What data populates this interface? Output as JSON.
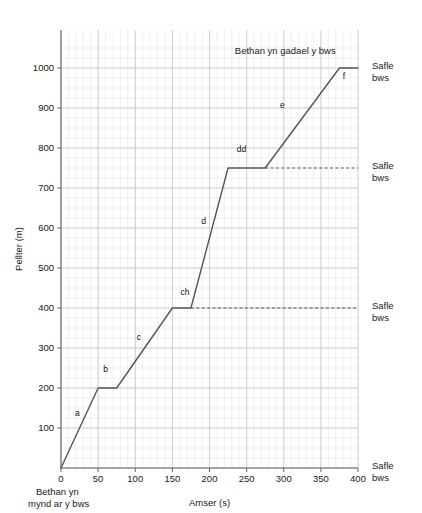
{
  "chart_data": {
    "type": "line",
    "title": "",
    "xlabel": "Amser (s)",
    "ylabel": "Pellter (m)",
    "xlim": [
      0,
      400
    ],
    "ylim": [
      0,
      1060
    ],
    "grid": true,
    "legend": "none",
    "x_ticks": [
      0,
      50,
      100,
      150,
      200,
      250,
      300,
      350,
      400
    ],
    "y_ticks": [
      100,
      200,
      300,
      400,
      500,
      600,
      700,
      800,
      900,
      1000
    ],
    "x_minor_step": 10,
    "y_minor_step": 25,
    "series": [
      {
        "name": "Taith Bethan",
        "color": "#555555",
        "points": [
          {
            "x": 0,
            "y": 0
          },
          {
            "x": 50,
            "y": 200
          },
          {
            "x": 75,
            "y": 200
          },
          {
            "x": 150,
            "y": 400
          },
          {
            "x": 175,
            "y": 400
          },
          {
            "x": 225,
            "y": 750
          },
          {
            "x": 275,
            "y": 750
          },
          {
            "x": 375,
            "y": 1000
          },
          {
            "x": 400,
            "y": 1000
          }
        ]
      }
    ],
    "segment_labels": [
      {
        "id": "a",
        "label": "a",
        "x": 22,
        "y": 130
      },
      {
        "id": "b",
        "label": "b",
        "x": 60,
        "y": 240
      },
      {
        "id": "c",
        "label": "c",
        "x": 105,
        "y": 320
      },
      {
        "id": "ch",
        "label": "ch",
        "x": 167,
        "y": 432
      },
      {
        "id": "d",
        "label": "d",
        "x": 192,
        "y": 610
      },
      {
        "id": "dd",
        "label": "dd",
        "x": 243,
        "y": 790
      },
      {
        "id": "e",
        "label": "e",
        "x": 298,
        "y": 900
      },
      {
        "id": "f",
        "label": "f",
        "x": 381,
        "y": 972
      }
    ],
    "dashed_guides": [
      {
        "y": 400,
        "from_x": 175,
        "to_x": 400
      },
      {
        "y": 750,
        "from_x": 275,
        "to_x": 400
      }
    ],
    "annotations": [
      {
        "id": "leave-bus",
        "text": "Bethan yn gadael y bws",
        "x": 370,
        "y": 1035,
        "anchor": "end"
      }
    ],
    "bus_stop_labels": [
      {
        "id": "stop-1000",
        "line1": "Safle",
        "line2": "bws",
        "y": 1000
      },
      {
        "id": "stop-750",
        "line1": "Safle",
        "line2": "bws",
        "y": 750
      },
      {
        "id": "stop-400",
        "line1": "Safle",
        "line2": "bws",
        "y": 400
      },
      {
        "id": "stop-0",
        "line1": "Safle",
        "line2": "bws",
        "y": 0
      }
    ],
    "corner_note": {
      "line1": "Bethan yn",
      "line2": "mynd ar y bws"
    },
    "colors": {
      "line": "#555555",
      "axis": "#666666",
      "major_grid": "#c9c9c9",
      "minor_grid": "#e4e4e4",
      "text": "#1a1a1a",
      "background": "#ffffff"
    }
  }
}
